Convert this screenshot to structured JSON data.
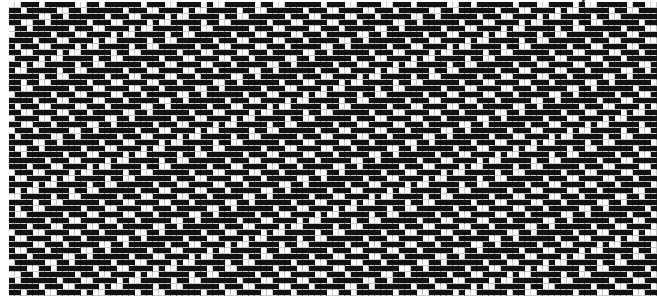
{
  "corner_label": "ᐟ◡◡",
  "pattern": {
    "rows": 49,
    "cols": 108,
    "cell_px": 6,
    "on_color": "#111111",
    "off_color": "#ffffff",
    "grid_color": "#c8c8c8",
    "shift_per_row": 3,
    "base_row": [
      0,
      0,
      1,
      1,
      1,
      0,
      1,
      1,
      1,
      1,
      1,
      0,
      0,
      1,
      1,
      0,
      1,
      1,
      1,
      1,
      1,
      1,
      0,
      1,
      1,
      1,
      0,
      0,
      1,
      1,
      1,
      1,
      0,
      1,
      0,
      0,
      1,
      1,
      1,
      1,
      1,
      0,
      1,
      1,
      0,
      0,
      1,
      1,
      1,
      1,
      1,
      1,
      0,
      1,
      1,
      1,
      0,
      0,
      1,
      1,
      1,
      1
    ]
  }
}
